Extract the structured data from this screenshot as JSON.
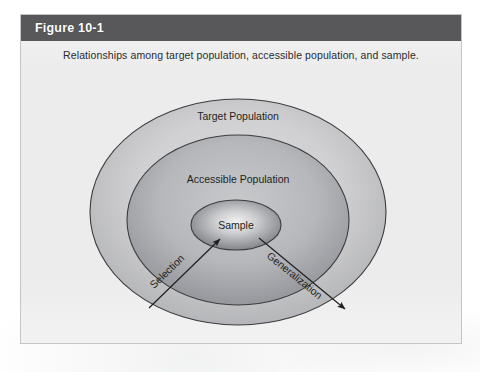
{
  "figure": {
    "number_label": "Figure 10-1",
    "caption": "Relationships among target population, accessible population, and sample."
  },
  "diagram": {
    "type": "nested-venn",
    "regions": [
      {
        "name": "target-population",
        "label": "Target Population",
        "level": 1,
        "fill_center": "#d6d6d7",
        "fill_edge": "#b4b5b7",
        "stroke": "#3c3c3e"
      },
      {
        "name": "accessible-population",
        "label": "Accessible Population",
        "level": 2,
        "fill_center": "#c0c1c3",
        "fill_edge": "#94959a",
        "stroke": "#3c3c3e"
      },
      {
        "name": "sample",
        "label": "Sample",
        "level": 3,
        "fill_center": "#eeeeef",
        "fill_edge": "#7c7d82",
        "stroke": "#3c3c3e"
      }
    ],
    "arrows": [
      {
        "name": "selection-arrow",
        "label": "Selection",
        "direction": "inward",
        "from": "target-population",
        "to": "sample"
      },
      {
        "name": "generalization-arrow",
        "label": "Generalization",
        "direction": "outward",
        "from": "sample",
        "to": "target-population"
      }
    ]
  },
  "colors": {
    "title_bar": "#58585a",
    "title_text": "#ffffff",
    "panel_background": "#ececed",
    "panel_border": "#c4c5c6",
    "page_background": "#ffffff",
    "text": "#1f1f21"
  }
}
